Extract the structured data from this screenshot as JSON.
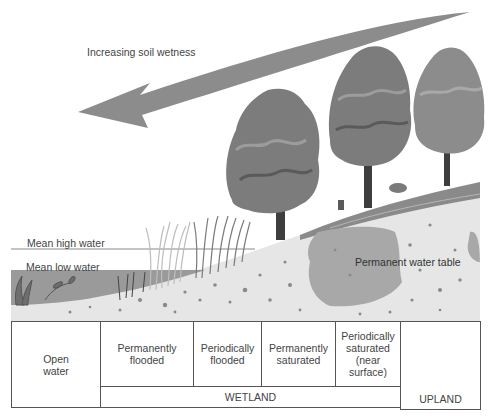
{
  "diagram": {
    "arrow_label": "Increasing soil wetness",
    "water_levels": {
      "high": "Mean high water",
      "low": "Mean low water"
    },
    "water_table_label": "Permanent water table",
    "zones": [
      {
        "label": "Open water"
      },
      {
        "label": "Permanently flooded"
      },
      {
        "label": "Periodically flooded"
      },
      {
        "label": "Permanently saturated"
      },
      {
        "label": "Periodically saturated (near surface)"
      },
      {
        "label": ""
      }
    ],
    "zone_lines": {
      "open_water": [
        "Open",
        "water"
      ],
      "perm_flooded": [
        "Permanently",
        "flooded"
      ],
      "period_flooded": [
        "Periodically",
        "flooded"
      ],
      "perm_saturated": [
        "Permanently",
        "saturated"
      ],
      "period_saturated": [
        "Periodically",
        "saturated",
        "(near",
        "surface)"
      ]
    },
    "groups": {
      "wetland": "WETLAND",
      "upland": "UPLAND"
    },
    "colors": {
      "arrow": "#8c8c8c",
      "water": "#9a9a9a",
      "soil": "#e6e6e6",
      "water_table": "#a8a8a8",
      "tree_dark": "#5a5a5a",
      "tree_mid": "#7c7c7c",
      "tree_light": "#9c9c9c",
      "hill": "#8a8a8a"
    }
  }
}
